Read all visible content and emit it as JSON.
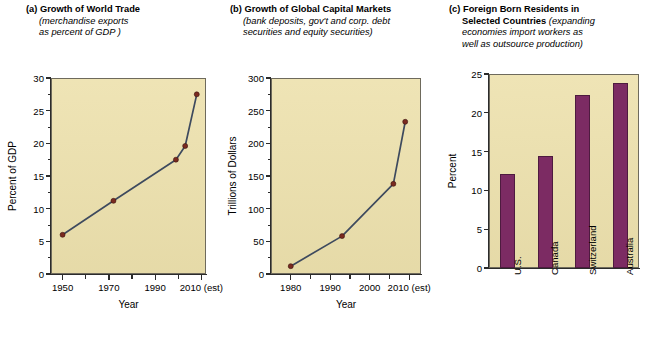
{
  "figure": {
    "background_color": "#ffffff",
    "plot_background_color": "#ede1ad",
    "line_color": "#3e4a5e",
    "marker_color": "#7a2a20",
    "bar_color": "#7c2b63"
  },
  "panels": {
    "a": {
      "label": "(a)",
      "title": "Growth of World Trade",
      "subtitle_line1": "(merchandise exports",
      "subtitle_line2": "as percent of GDP )"
    },
    "b": {
      "label": "(b)",
      "title": "Growth of Global Capital Markets",
      "subtitle_line1": "(bank deposits, gov't and corp. debt",
      "subtitle_line2": "securities and equity securities)"
    },
    "c": {
      "label": "(c)",
      "title_line1": "Foreign Born Residents in",
      "title_line2": "Selected Countries",
      "subtitle_line2_ital": "(expanding",
      "subtitle_line3": "economies import workers as",
      "subtitle_line4": "well as outsource production)"
    }
  },
  "chart_data": [
    {
      "id": "a",
      "type": "line",
      "title": "Growth of World Trade",
      "xlabel": "Year",
      "ylabel": "Percent of GDP",
      "xlim": [
        1945,
        2012
      ],
      "ylim": [
        0,
        30
      ],
      "ytick_labels": [
        "0",
        "5",
        "10",
        "15",
        "20",
        "25",
        "30"
      ],
      "ytick_values": [
        0,
        5,
        10,
        15,
        20,
        25,
        30
      ],
      "yminor_step": 2.5,
      "xtick_labels": [
        "1950",
        "1970",
        "1990",
        "2010 (est)"
      ],
      "xtick_values": [
        1950,
        1970,
        1990,
        2010
      ],
      "xminor_values": [
        1960,
        1980,
        2000
      ],
      "grid": false,
      "legend": "none",
      "x": [
        1950,
        1972,
        1999,
        2003,
        2008
      ],
      "values": [
        6.0,
        11.2,
        17.5,
        19.6,
        27.5
      ]
    },
    {
      "id": "b",
      "type": "line",
      "title": "Growth of Global Capital Markets",
      "xlabel": "Year",
      "ylabel": "Trillions of Dollars",
      "xlim": [
        1975,
        2013
      ],
      "ylim": [
        0,
        300
      ],
      "ytick_labels": [
        "0",
        "50",
        "100",
        "150",
        "200",
        "250",
        "300"
      ],
      "ytick_values": [
        0,
        50,
        100,
        150,
        200,
        250,
        300
      ],
      "yminor_step": 25,
      "xtick_labels": [
        "1980",
        "1990",
        "2000",
        "2010 (est)"
      ],
      "xtick_values": [
        1980,
        1990,
        2000,
        2010
      ],
      "xminor_values": [
        1985,
        1995,
        2005
      ],
      "grid": false,
      "legend": "none",
      "x": [
        1980,
        1993,
        2006,
        2009
      ],
      "values": [
        12,
        58,
        138,
        233
      ]
    },
    {
      "id": "c",
      "type": "bar",
      "title": "Foreign Born Residents in Selected Countries",
      "xlabel": "",
      "ylabel": "Percent",
      "ylim": [
        0,
        25
      ],
      "ytick_labels": [
        "0",
        "5",
        "10",
        "15",
        "20",
        "25"
      ],
      "ytick_values": [
        0,
        5,
        10,
        15,
        20,
        25
      ],
      "grid": false,
      "legend": "none",
      "categories": [
        "U.S.",
        "Canada",
        "Switzerland",
        "Australia"
      ],
      "values": [
        12.1,
        14.4,
        22.3,
        23.8
      ]
    }
  ]
}
